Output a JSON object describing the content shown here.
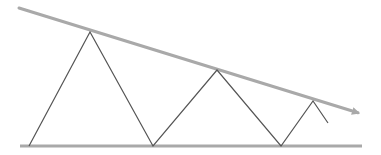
{
  "diagram": {
    "colors": {
      "background": "#ffffff",
      "trendline": "#a9a9a9",
      "support": "#a9a9a9",
      "price": "#555555"
    },
    "resistance_line": {
      "x1": 19,
      "y1": 8,
      "x2": 362,
      "y2": 114,
      "arrow": true
    },
    "support_line": {
      "x1": 20,
      "y1": 146,
      "x2": 362,
      "y2": 146
    },
    "price_path": [
      [
        29,
        146
      ],
      [
        90,
        32
      ],
      [
        153,
        146
      ],
      [
        217,
        70
      ],
      [
        281,
        146
      ],
      [
        313,
        101
      ],
      [
        328,
        123
      ]
    ]
  }
}
